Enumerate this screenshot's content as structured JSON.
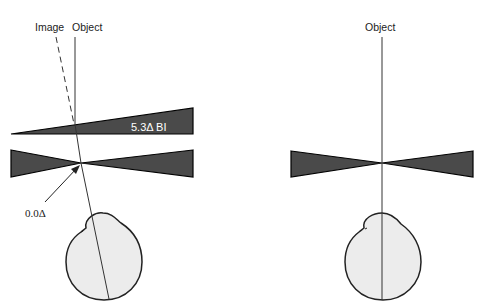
{
  "colors": {
    "prism_fill": "#4a4a4a",
    "prism_stroke": "#000000",
    "eye_fill": "#ececec",
    "eye_stroke": "#222222",
    "ray": "#333333",
    "background": "#ffffff"
  },
  "left_panel": {
    "image_label": "Image",
    "object_label": "Object",
    "prism_label": "5.3Δ BI",
    "resultant_label": "0.0Δ",
    "elements": [
      "base-in wedge prism",
      "bowtie prism (neutral point)",
      "eye",
      "object ray",
      "dashed image ray",
      "pointer arrow"
    ]
  },
  "right_panel": {
    "object_label": "Object",
    "elements": [
      "bowtie prism (neutral point)",
      "eye",
      "object ray"
    ]
  }
}
